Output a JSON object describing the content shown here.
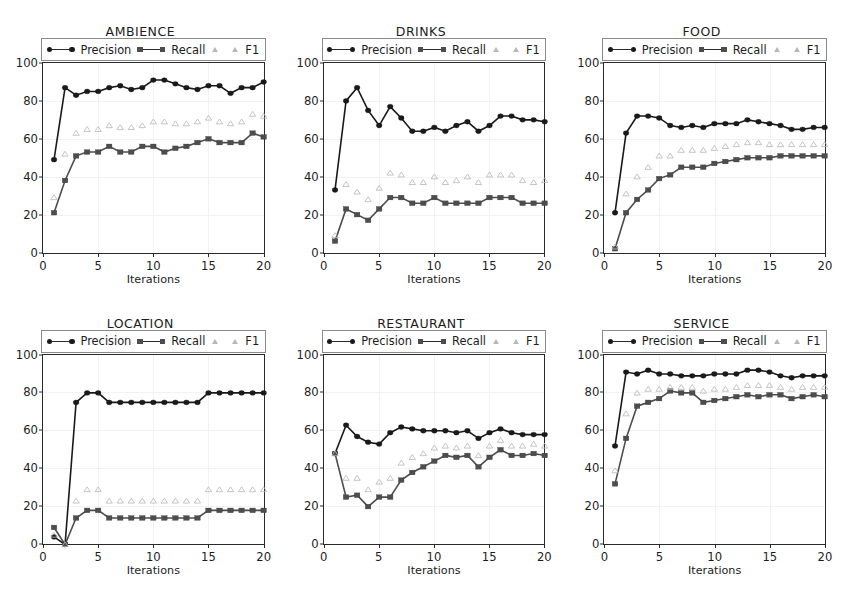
{
  "figure": {
    "cut_caption": "",
    "layout": "2x3 grid of line charts",
    "panel_count": 6
  },
  "legend": {
    "precision_label": "Precision",
    "recall_label": "Recall",
    "f1_label": "F1"
  },
  "axes": {
    "xlabel": "Iterations",
    "yticks": [
      "0",
      "20",
      "40",
      "60",
      "80",
      "100"
    ],
    "ytick_values": [
      0,
      20,
      40,
      60,
      80,
      100
    ],
    "xticks": [
      "0",
      "5",
      "10",
      "15",
      "20"
    ],
    "xtick_values": [
      0,
      5,
      10,
      15,
      20
    ],
    "xlim": [
      0,
      20
    ],
    "ylim": [
      0,
      100
    ]
  },
  "colors": {
    "precision": "#1a1a1a",
    "recall": "#4d4d4d",
    "f1": "#b8b8b8",
    "axis": "#2a2a2a",
    "grid": "#f2f2f2",
    "background": "#ffffff"
  },
  "titles": {
    "p0": "AMBIENCE",
    "p1": "DRINKS",
    "p2": "FOOD",
    "p3": "LOCATION",
    "p4": "RESTAURANT",
    "p5": "SERVICE"
  },
  "chart_data": [
    {
      "type": "line",
      "title": "AMBIENCE",
      "xlabel": "Iterations",
      "ylabel": "",
      "xlim": [
        0,
        20
      ],
      "ylim": [
        0,
        100
      ],
      "grid": true,
      "legend_position": "upper-outside",
      "x": [
        1,
        2,
        3,
        4,
        5,
        6,
        7,
        8,
        9,
        10,
        11,
        12,
        13,
        14,
        15,
        16,
        17,
        18,
        19,
        20
      ],
      "series": [
        {
          "name": "Precision",
          "marker": "circle",
          "line": true,
          "values": [
            49,
            87,
            83,
            85,
            85,
            87,
            88,
            86,
            87,
            91,
            91,
            89,
            87,
            86,
            88,
            88,
            84,
            87,
            87,
            90
          ]
        },
        {
          "name": "Recall",
          "marker": "square",
          "line": true,
          "values": [
            21,
            38,
            51,
            53,
            53,
            56,
            53,
            53,
            56,
            56,
            53,
            55,
            56,
            58,
            60,
            58,
            58,
            58,
            63,
            61
          ]
        },
        {
          "name": "F1",
          "marker": "triangle",
          "line": false,
          "values": [
            29,
            52,
            63,
            65,
            65,
            67,
            66,
            66,
            67,
            69,
            69,
            68,
            68,
            69,
            71,
            69,
            68,
            69,
            73,
            72
          ]
        }
      ]
    },
    {
      "type": "line",
      "title": "DRINKS",
      "xlabel": "Iterations",
      "ylabel": "",
      "xlim": [
        0,
        20
      ],
      "ylim": [
        0,
        100
      ],
      "grid": true,
      "legend_position": "upper-outside",
      "x": [
        1,
        2,
        3,
        4,
        5,
        6,
        7,
        8,
        9,
        10,
        11,
        12,
        13,
        14,
        15,
        16,
        17,
        18,
        19,
        20
      ],
      "series": [
        {
          "name": "Precision",
          "marker": "circle",
          "line": true,
          "values": [
            33,
            80,
            87,
            75,
            67,
            77,
            71,
            64,
            64,
            66,
            64,
            67,
            69,
            64,
            67,
            72,
            72,
            70,
            70,
            69
          ]
        },
        {
          "name": "Recall",
          "marker": "square",
          "line": true,
          "values": [
            6,
            23,
            20,
            17,
            23,
            29,
            29,
            26,
            26,
            29,
            26,
            26,
            26,
            26,
            29,
            29,
            29,
            26,
            26,
            26
          ]
        },
        {
          "name": "F1",
          "marker": "triangle",
          "line": false,
          "values": [
            9,
            36,
            32,
            28,
            34,
            42,
            41,
            37,
            37,
            40,
            37,
            38,
            40,
            37,
            41,
            41,
            41,
            38,
            37,
            38
          ]
        }
      ]
    },
    {
      "type": "line",
      "title": "FOOD",
      "xlabel": "Iterations",
      "ylabel": "",
      "xlim": [
        0,
        20
      ],
      "ylim": [
        0,
        100
      ],
      "grid": true,
      "legend_position": "upper-outside",
      "x": [
        1,
        2,
        3,
        4,
        5,
        6,
        7,
        8,
        9,
        10,
        11,
        12,
        13,
        14,
        15,
        16,
        17,
        18,
        19,
        20
      ],
      "series": [
        {
          "name": "Precision",
          "marker": "circle",
          "line": true,
          "values": [
            21,
            63,
            72,
            72,
            71,
            67,
            66,
            67,
            66,
            68,
            68,
            68,
            70,
            69,
            68,
            67,
            65,
            65,
            66,
            66
          ]
        },
        {
          "name": "Recall",
          "marker": "square",
          "line": true,
          "values": [
            2,
            21,
            28,
            33,
            39,
            41,
            45,
            45,
            45,
            47,
            48,
            49,
            50,
            50,
            50,
            51,
            51,
            51,
            51,
            51
          ]
        },
        {
          "name": "F1",
          "marker": "triangle",
          "line": false,
          "values": [
            3,
            31,
            40,
            45,
            51,
            51,
            54,
            54,
            54,
            55,
            56,
            57,
            58,
            58,
            57,
            57,
            57,
            57,
            57,
            57
          ]
        }
      ]
    },
    {
      "type": "line",
      "title": "LOCATION",
      "xlabel": "Iterations",
      "ylabel": "",
      "xlim": [
        0,
        20
      ],
      "ylim": [
        0,
        100
      ],
      "grid": true,
      "legend_position": "upper-outside",
      "x": [
        1,
        2,
        3,
        4,
        5,
        6,
        7,
        8,
        9,
        10,
        11,
        12,
        13,
        14,
        15,
        16,
        17,
        18,
        19,
        20
      ],
      "series": [
        {
          "name": "Precision",
          "marker": "circle",
          "line": true,
          "values": [
            4,
            0,
            75,
            80,
            80,
            75,
            75,
            75,
            75,
            75,
            75,
            75,
            75,
            75,
            80,
            80,
            80,
            80,
            80,
            80
          ]
        },
        {
          "name": "Recall",
          "marker": "square",
          "line": true,
          "values": [
            9,
            0,
            14,
            18,
            18,
            14,
            14,
            14,
            14,
            14,
            14,
            14,
            14,
            14,
            18,
            18,
            18,
            18,
            18,
            18
          ]
        },
        {
          "name": "F1",
          "marker": "triangle",
          "line": false,
          "values": [
            5,
            0,
            23,
            29,
            29,
            23,
            23,
            23,
            23,
            23,
            23,
            23,
            23,
            23,
            29,
            29,
            29,
            29,
            29,
            29
          ]
        }
      ]
    },
    {
      "type": "line",
      "title": "RESTAURANT",
      "xlabel": "Iterations",
      "ylabel": "",
      "xlim": [
        0,
        20
      ],
      "ylim": [
        0,
        100
      ],
      "grid": true,
      "legend_position": "upper-outside",
      "x": [
        1,
        2,
        3,
        4,
        5,
        6,
        7,
        8,
        9,
        10,
        11,
        12,
        13,
        14,
        15,
        16,
        17,
        18,
        19,
        20
      ],
      "series": [
        {
          "name": "Precision",
          "marker": "circle",
          "line": true,
          "values": [
            48,
            63,
            57,
            54,
            53,
            59,
            62,
            61,
            60,
            60,
            60,
            59,
            60,
            56,
            59,
            61,
            59,
            58,
            58,
            58
          ]
        },
        {
          "name": "Recall",
          "marker": "square",
          "line": true,
          "values": [
            48,
            25,
            26,
            20,
            25,
            25,
            34,
            38,
            41,
            44,
            47,
            46,
            47,
            41,
            46,
            50,
            47,
            47,
            48,
            47
          ]
        },
        {
          "name": "F1",
          "marker": "triangle",
          "line": false,
          "values": [
            48,
            35,
            35,
            29,
            33,
            35,
            43,
            46,
            48,
            51,
            52,
            51,
            52,
            47,
            52,
            55,
            52,
            52,
            53,
            52
          ]
        }
      ]
    },
    {
      "type": "line",
      "title": "SERVICE",
      "xlabel": "Iterations",
      "ylabel": "",
      "xlim": [
        0,
        20
      ],
      "ylim": [
        0,
        100
      ],
      "grid": true,
      "legend_position": "upper-outside",
      "x": [
        1,
        2,
        3,
        4,
        5,
        6,
        7,
        8,
        9,
        10,
        11,
        12,
        13,
        14,
        15,
        16,
        17,
        18,
        19,
        20
      ],
      "series": [
        {
          "name": "Precision",
          "marker": "circle",
          "line": true,
          "values": [
            52,
            91,
            90,
            92,
            90,
            90,
            89,
            89,
            89,
            90,
            90,
            90,
            92,
            92,
            91,
            89,
            88,
            89,
            89,
            89
          ]
        },
        {
          "name": "Recall",
          "marker": "square",
          "line": true,
          "values": [
            32,
            56,
            73,
            75,
            77,
            81,
            80,
            80,
            75,
            76,
            77,
            78,
            79,
            78,
            79,
            79,
            77,
            78,
            79,
            78
          ]
        },
        {
          "name": "F1",
          "marker": "triangle",
          "line": false,
          "values": [
            39,
            69,
            80,
            82,
            82,
            83,
            83,
            83,
            81,
            82,
            82,
            83,
            84,
            84,
            84,
            83,
            82,
            83,
            83,
            83
          ]
        }
      ]
    }
  ]
}
